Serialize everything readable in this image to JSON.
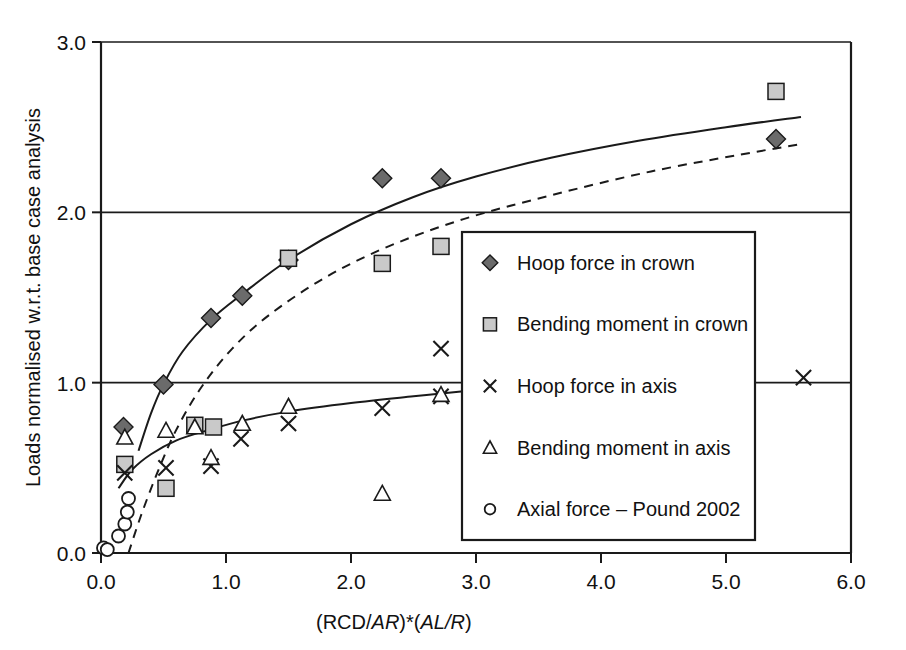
{
  "chart_data": {
    "type": "scatter",
    "title": "",
    "xlabel": "(RCD/AR)*(AL/R)",
    "xlabel_parts": [
      {
        "text": "(RCD/",
        "italic": false
      },
      {
        "text": "AR",
        "italic": true
      },
      {
        "text": ")*(",
        "italic": false
      },
      {
        "text": "AL/R",
        "italic": true
      },
      {
        "text": ")",
        "italic": false
      }
    ],
    "ylabel": "Loads normalised w.r.t. base case analysis",
    "xlim": [
      0.0,
      6.0
    ],
    "ylim": [
      0.0,
      3.0
    ],
    "xticks": [
      "0.0",
      "1.0",
      "2.0",
      "3.0",
      "4.0",
      "5.0",
      "6.0"
    ],
    "yticks": [
      "0.0",
      "1.0",
      "2.0",
      "3.0"
    ],
    "xtick_values": [
      0.0,
      1.0,
      2.0,
      3.0,
      4.0,
      5.0,
      6.0
    ],
    "ytick_values": [
      0.0,
      1.0,
      2.0,
      3.0
    ],
    "grid": "horizontal-at-1.0-2.0-3.0",
    "legend_position": "center-right-inside",
    "series": [
      {
        "name": "Hoop force in crown",
        "marker": "diamond",
        "marker_fill": "#6b6b6b",
        "points": [
          [
            0.18,
            0.74
          ],
          [
            0.5,
            0.99
          ],
          [
            0.88,
            1.38
          ],
          [
            1.13,
            1.51
          ],
          [
            1.5,
            1.72
          ],
          [
            2.25,
            2.2
          ],
          [
            2.72,
            2.2
          ],
          [
            5.4,
            2.43
          ]
        ]
      },
      {
        "name": "Bending moment in crown",
        "marker": "square",
        "marker_fill": "#c9c9c9",
        "points": [
          [
            0.19,
            0.52
          ],
          [
            0.52,
            0.38
          ],
          [
            0.75,
            0.75
          ],
          [
            0.9,
            0.74
          ],
          [
            1.5,
            1.73
          ],
          [
            2.25,
            1.7
          ],
          [
            2.72,
            1.8
          ],
          [
            5.4,
            2.71
          ]
        ]
      },
      {
        "name": "Hoop force in axis",
        "marker": "cross",
        "marker_fill": "none",
        "points": [
          [
            0.19,
            0.47
          ],
          [
            0.52,
            0.5
          ],
          [
            0.88,
            0.51
          ],
          [
            1.12,
            0.67
          ],
          [
            1.5,
            0.76
          ],
          [
            2.25,
            0.85
          ],
          [
            2.72,
            1.2
          ],
          [
            2.72,
            0.92
          ],
          [
            5.62,
            1.03
          ]
        ]
      },
      {
        "name": "Bending moment in axis",
        "marker": "triangle",
        "marker_fill": "#ffffff",
        "points": [
          [
            0.19,
            0.68
          ],
          [
            0.52,
            0.72
          ],
          [
            0.75,
            0.74
          ],
          [
            0.88,
            0.56
          ],
          [
            1.13,
            0.76
          ],
          [
            1.5,
            0.86
          ],
          [
            2.25,
            0.35
          ],
          [
            2.72,
            0.93
          ]
        ]
      },
      {
        "name": "Axial force – Pound 2002",
        "marker": "circle",
        "marker_fill": "#ffffff",
        "points": [
          [
            0.02,
            0.03
          ],
          [
            0.05,
            0.02
          ],
          [
            0.14,
            0.1
          ],
          [
            0.19,
            0.17
          ],
          [
            0.21,
            0.24
          ],
          [
            0.22,
            0.32
          ]
        ]
      }
    ],
    "fit_curves": [
      {
        "name": "hoop-force-crown-fit",
        "style": "solid",
        "points": [
          [
            0.3,
            0.6
          ],
          [
            0.4,
            0.82
          ],
          [
            0.5,
            0.99
          ],
          [
            0.65,
            1.18
          ],
          [
            0.88,
            1.37
          ],
          [
            1.13,
            1.52
          ],
          [
            1.5,
            1.72
          ],
          [
            2.0,
            1.93
          ],
          [
            2.5,
            2.09
          ],
          [
            3.0,
            2.21
          ],
          [
            3.6,
            2.32
          ],
          [
            4.3,
            2.42
          ],
          [
            5.0,
            2.5
          ],
          [
            5.6,
            2.56
          ]
        ]
      },
      {
        "name": "bending-moment-crown-fit",
        "style": "dashed",
        "points": [
          [
            0.22,
            0.0
          ],
          [
            0.32,
            0.22
          ],
          [
            0.45,
            0.47
          ],
          [
            0.6,
            0.72
          ],
          [
            0.8,
            0.97
          ],
          [
            1.05,
            1.2
          ],
          [
            1.35,
            1.4
          ],
          [
            1.8,
            1.62
          ],
          [
            2.3,
            1.8
          ],
          [
            2.9,
            1.96
          ],
          [
            3.6,
            2.1
          ],
          [
            4.4,
            2.24
          ],
          [
            5.2,
            2.35
          ],
          [
            5.6,
            2.4
          ]
        ]
      },
      {
        "name": "axis-loads-fit",
        "style": "solid",
        "points": [
          [
            0.14,
            0.38
          ],
          [
            0.25,
            0.49
          ],
          [
            0.4,
            0.58
          ],
          [
            0.6,
            0.66
          ],
          [
            0.85,
            0.72
          ],
          [
            1.15,
            0.78
          ],
          [
            1.5,
            0.83
          ],
          [
            2.0,
            0.88
          ],
          [
            2.5,
            0.92
          ],
          [
            2.9,
            0.95
          ]
        ]
      }
    ]
  },
  "legend": {
    "items": [
      {
        "label": "Hoop force in crown",
        "marker": "diamond"
      },
      {
        "label": "Bending moment in crown",
        "marker": "square"
      },
      {
        "label": "Hoop force in axis",
        "marker": "cross"
      },
      {
        "label": "Bending moment in axis",
        "marker": "triangle"
      },
      {
        "label": "Axial force – Pound 2002",
        "marker": "circle"
      }
    ]
  },
  "colors": {
    "axis": "#1a1a1a",
    "diamond_fill": "#6b6b6b",
    "square_fill": "#c9c9c9",
    "background": "#ffffff"
  }
}
